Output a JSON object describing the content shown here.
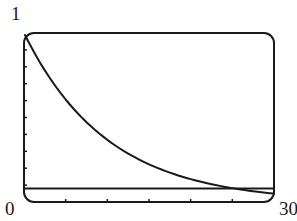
{
  "chart_data": {
    "type": "line",
    "title": "",
    "xlabel": "",
    "ylabel": "",
    "xlim": [
      0,
      30
    ],
    "ylim": [
      0,
      1
    ],
    "x_tick_labels": {
      "min": "0",
      "max": "30"
    },
    "y_tick_labels": {
      "max": "1"
    },
    "x_ticks": [
      0,
      5,
      10,
      15,
      20,
      25,
      30
    ],
    "y_ticks": [
      0,
      0.1,
      0.2,
      0.3,
      0.4,
      0.5,
      0.6,
      0.7,
      0.8,
      0.9,
      1.0
    ],
    "grid": false,
    "legend": null,
    "series": [
      {
        "name": "decay curve",
        "description": "exponential decay approx y = e^(-0.1x)",
        "x": [
          0,
          2.5,
          5,
          7.5,
          10,
          12.5,
          15,
          17.5,
          20,
          22.5,
          25,
          27.5,
          30
        ],
        "values": [
          1.0,
          0.78,
          0.61,
          0.47,
          0.37,
          0.29,
          0.22,
          0.17,
          0.14,
          0.11,
          0.08,
          0.06,
          0.05
        ]
      },
      {
        "name": "horizontal reference line",
        "x": [
          0,
          30
        ],
        "values": [
          0.08,
          0.08
        ]
      }
    ],
    "colors": {
      "curve": "#1a1a1a",
      "frame": "#1a1a1a"
    }
  },
  "labels": {
    "y_max": "1",
    "x_min": "0",
    "x_max": "30"
  }
}
